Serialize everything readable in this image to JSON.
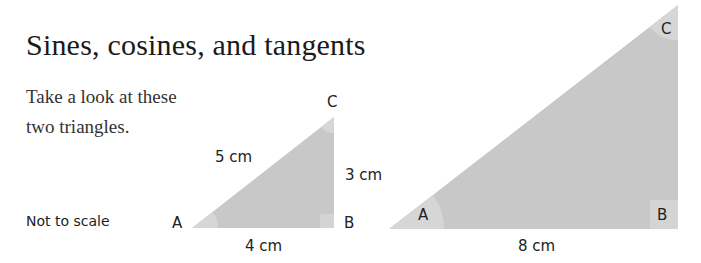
{
  "title": "Sines, cosines, and tangents",
  "intro": "Take a look at these two triangles.",
  "note": "Not to scale",
  "colors": {
    "triangle_fill": "#c8c8c8",
    "angle_marker": "#d8d8d8"
  },
  "triangles": [
    {
      "name": "small",
      "vertices": {
        "A": "A",
        "B": "B",
        "C": "C"
      },
      "sides": {
        "hypotenuse": "5 cm",
        "opposite": "3 cm",
        "adjacent": "4 cm"
      }
    },
    {
      "name": "large",
      "vertices": {
        "A": "A",
        "B": "B",
        "C": "C"
      },
      "sides": {
        "adjacent": "8 cm"
      }
    }
  ]
}
